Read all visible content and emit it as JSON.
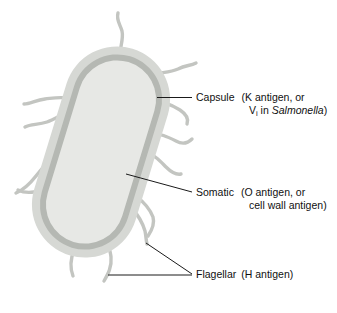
{
  "figure": {
    "width": 337,
    "height": 313,
    "background": "#ffffff"
  },
  "colors": {
    "capsule": "#d6d8d4",
    "cell_wall": "#b5b8b3",
    "cytoplasm": "#e7e8e5",
    "flagella": "#c3c5c1",
    "leader_line": "#1a1a1a",
    "text": "#101010"
  },
  "labels": {
    "capsule": {
      "term": "Capsule",
      "detail_line1": "(K antigen, or",
      "detail_line2_prefix": "V",
      "detail_line2_subscript": "i",
      "detail_line2_mid": " in ",
      "detail_line2_italic": "Salmonella",
      "detail_line2_suffix": ")"
    },
    "somatic": {
      "term": "Somatic",
      "detail_line1": "(O antigen, or",
      "detail_line2": "cell wall antigen)"
    },
    "flagellar": {
      "term": "Flagellar",
      "detail_line1": "(H antigen)"
    }
  },
  "structures": {
    "capsule_layer": "capsule",
    "cell_wall_layer": "cell-wall",
    "cytoplasm_layer": "cytoplasm",
    "flagella_count": 13
  }
}
